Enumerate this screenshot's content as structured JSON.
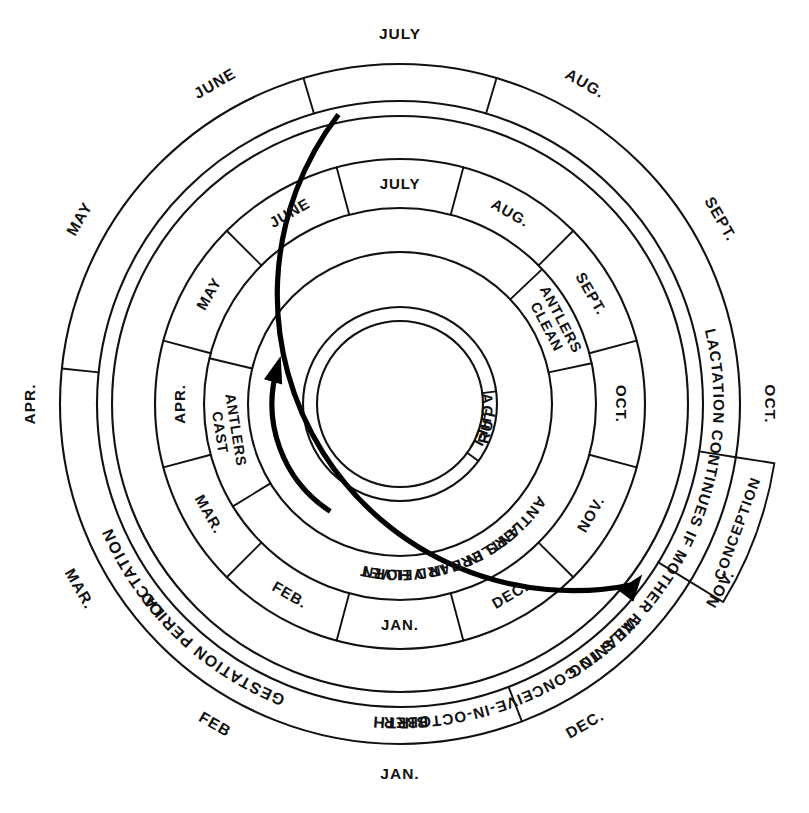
{
  "geometry": {
    "center_x": 400,
    "center_y": 404,
    "radii": {
      "outer_month_text": 370,
      "ring1_outer": 340,
      "ring1_inner": 303,
      "ring2_outer": 288,
      "ring2_inner": 245,
      "ring3_outer": 245,
      "ring3_inner": 196,
      "ring4_outer": 196,
      "ring4_inner": 152,
      "ring5_outer": 152,
      "ring5_inner": 97,
      "core": 83
    },
    "month_start_angle_deg": -90,
    "degrees_per_month": 30
  },
  "colors": {
    "ink": "#111111",
    "paper": "#ffffff",
    "arrow": "#000000"
  },
  "outer_months": [
    {
      "label": "JULY",
      "index": 0
    },
    {
      "label": "AUG.",
      "index": 1
    },
    {
      "label": "SEPT.",
      "index": 2
    },
    {
      "label": "OCT.",
      "index": 3
    },
    {
      "label": "NOV.",
      "index": 4
    },
    {
      "label": "DEC.",
      "index": 5
    },
    {
      "label": "JAN.",
      "index": 6
    },
    {
      "label": "FEB",
      "index": 7
    },
    {
      "label": "MAR.",
      "index": 8
    },
    {
      "label": "APR.",
      "index": 9
    },
    {
      "label": "MAY",
      "index": 10
    },
    {
      "label": "JUNE",
      "index": 11
    }
  ],
  "hind_ring": {
    "name": "female-reproductive-cycle-ring",
    "segments": [
      {
        "label": "BIRTH",
        "start_month": 11.45,
        "end_month": 0.55,
        "two_line": false
      },
      {
        "label": "LACTATION",
        "start_month": 0.55,
        "end_month": 3.3,
        "two_line": false
      },
      {
        "label": "CONCEPTION",
        "start_month": 3.3,
        "end_month": 4.05,
        "two_line": false
      },
      {
        "label": "WEANING",
        "start_month": 4.05,
        "end_month": 5.3,
        "two_line": false
      },
      {
        "label": "GESTATION PERIOD",
        "start_month": 5.3,
        "end_month": 9.2,
        "two_line": false
      },
      {
        "label": "LACTATION CONTINUES IF MOTHER FAILS TO CONCEIVE-IN-OCTOBER",
        "start_month": 9.2,
        "end_month": 11.45,
        "two_line": false
      }
    ]
  },
  "inner_months": [
    {
      "label": "JULY",
      "index": 0
    },
    {
      "label": "AUG.",
      "index": 1
    },
    {
      "label": "SEPT.",
      "index": 2
    },
    {
      "label": "OCT.",
      "index": 3
    },
    {
      "label": "NOV.",
      "index": 4
    },
    {
      "label": "DEC.",
      "index": 5
    },
    {
      "label": "JAN.",
      "index": 6
    },
    {
      "label": "FEB.",
      "index": 7
    },
    {
      "label": "MAR.",
      "index": 8
    },
    {
      "label": "APR.",
      "index": 9
    },
    {
      "label": "MAY",
      "index": 10
    },
    {
      "label": "JUNE",
      "index": 11
    }
  ],
  "antler_ring": {
    "name": "antler-cycle-ring",
    "segments": [
      {
        "label": "ANTLERS IN VELVET",
        "start_month": 9.45,
        "end_month": 1.55,
        "lines": [
          "ANTLERS IN VELVET"
        ]
      },
      {
        "label": "ANTLERS CLEAN",
        "start_month": 1.55,
        "end_month": 2.6,
        "lines": [
          "ANTLERS",
          "CLEAN"
        ]
      },
      {
        "label": "ANTLERS IN HARD HORN",
        "start_month": 2.6,
        "end_month": 7.95,
        "lines": [
          "ANTLERS IN HARD HORN"
        ]
      },
      {
        "label": "ANTLERS CAST",
        "start_month": 7.95,
        "end_month": 9.45,
        "lines": [
          "ANTLERS",
          "CAST"
        ]
      }
    ]
  },
  "core_ring": {
    "name": "stag-behaviour-ring",
    "segments": [
      {
        "label": "RUT",
        "start_month": 2.75,
        "end_month": 4.2
      },
      {
        "label": "STAGS IN BACHELOR GROUPS",
        "start_month": 4.2,
        "end_month": 2.75
      }
    ]
  },
  "arrows": [
    {
      "name": "lactation-to-conception-arrow",
      "from_month": 11.6,
      "to_month": 4.25,
      "radius": 296
    },
    {
      "name": "hard-horn-to-cast-arrow",
      "from_month": 7.1,
      "to_month": 9.55,
      "radius": 128
    }
  ]
}
